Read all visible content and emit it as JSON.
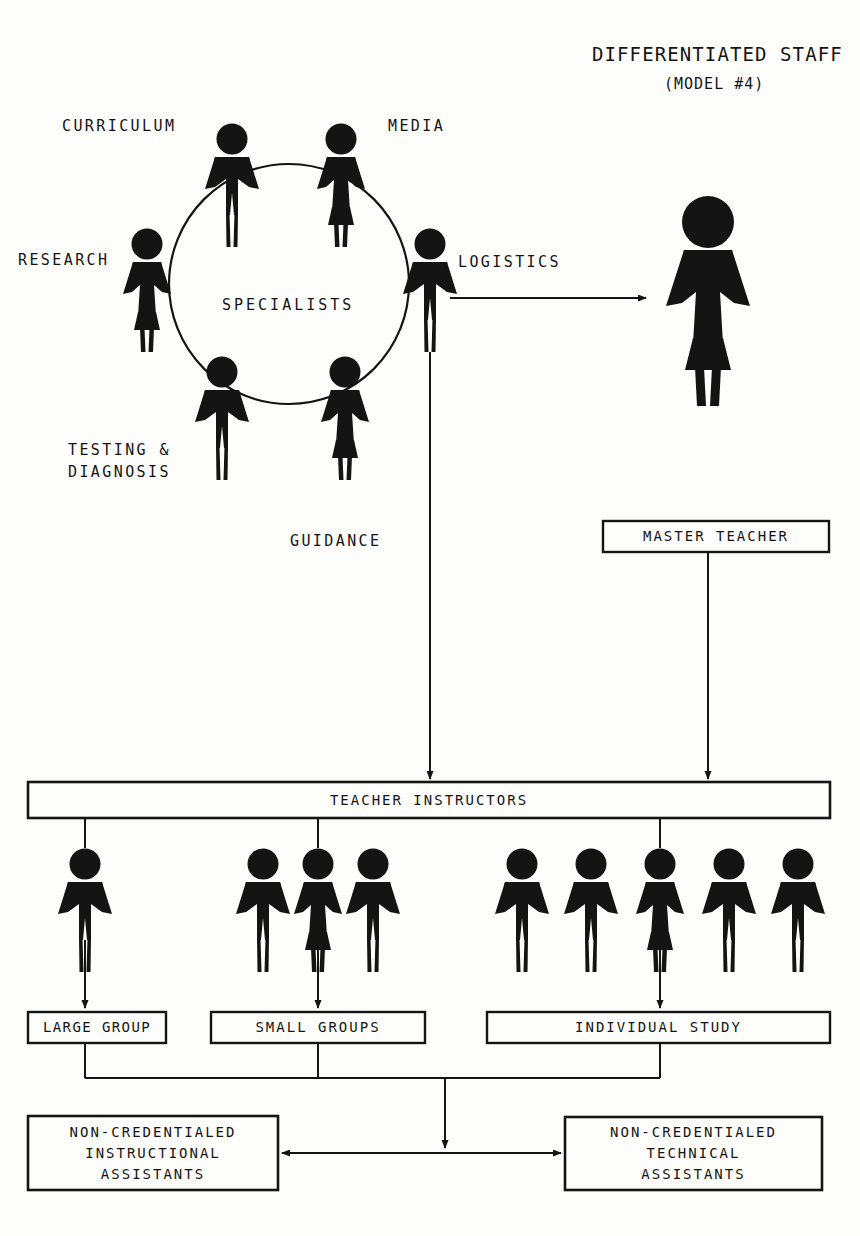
{
  "title": {
    "main": "DIFFERENTIATED STAFF",
    "sub": "(MODEL #4)"
  },
  "specialists": {
    "center_label": "SPECIALISTS",
    "roles": [
      {
        "label": "CURRICULUM"
      },
      {
        "label": "MEDIA"
      },
      {
        "label": "RESEARCH"
      },
      {
        "label": "LOGISTICS"
      },
      {
        "label": "TESTING &",
        "label2": "DIAGNOSIS"
      },
      {
        "label": "GUIDANCE"
      }
    ]
  },
  "boxes": {
    "master_teacher": "MASTER TEACHER",
    "teacher_instructors": "TEACHER INSTRUCTORS",
    "large_group": "LARGE GROUP",
    "small_groups": "SMALL GROUPS",
    "individual_study": "INDIVIDUAL STUDY",
    "instructional_assistants": [
      "NON-CREDENTIALED",
      "INSTRUCTIONAL",
      "ASSISTANTS"
    ],
    "technical_assistants": [
      "NON-CREDENTIALED",
      "TECHNICAL",
      "ASSISTANTS"
    ]
  },
  "colors": {
    "ink": "#141414",
    "paper": "#fdfdfb"
  },
  "figure_counts": {
    "specialists_circle": 6,
    "large_group": 1,
    "small_groups": 3,
    "individual_study": 5,
    "master_teacher": 1
  }
}
